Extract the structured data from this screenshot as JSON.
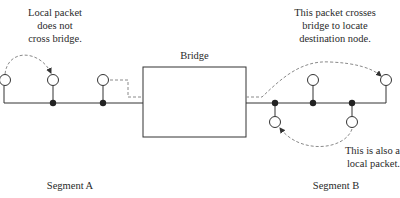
{
  "annotations": {
    "left_packet": [
      "Local packet",
      "does not",
      "cross bridge."
    ],
    "right_packet": [
      "This packet crosses",
      "bridge to locate",
      "destination node."
    ],
    "bottom_packet": [
      "This is also a",
      "local packet."
    ]
  },
  "bridge": {
    "label": "Bridge"
  },
  "segments": {
    "a": {
      "label": "Segment A"
    },
    "b": {
      "label": "Segment B"
    }
  },
  "colors": {
    "line": "#333333",
    "dashed": "#8a8a8a",
    "node_fill": "#222222"
  }
}
